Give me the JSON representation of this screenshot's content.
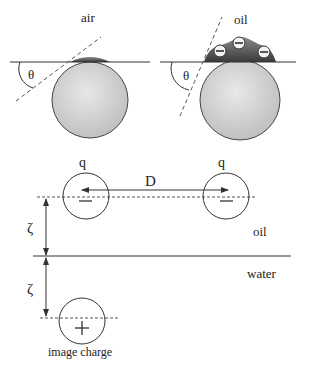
{
  "panels": {
    "air_particle": {
      "medium_label": "air",
      "angle_label": "θ"
    },
    "oil_particle": {
      "medium_label": "oil",
      "angle_label": "θ",
      "ion_symbol": "−",
      "ion_count": 3
    }
  },
  "interaction": {
    "charge_left_label": "q",
    "charge_right_label": "q",
    "charge_sign": "−",
    "distance_label": "D",
    "height_label_upper": "ζ",
    "height_label_lower": "ζ",
    "upper_medium_label": "oil",
    "lower_medium_label": "water",
    "image_charge_sign": "+",
    "image_charge_label": "image charge"
  },
  "colors": {
    "line": "#333333",
    "sphere_fill": "#d4d4d4",
    "cap_fill": "#555555",
    "background": "#ffffff"
  }
}
